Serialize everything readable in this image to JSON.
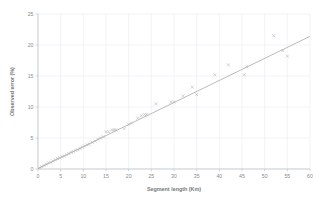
{
  "chart_data": {
    "type": "scatter",
    "title": "",
    "subtitle": "",
    "xlabel": "Segment length (Km)",
    "ylabel": "Observed error (%)",
    "xlim": [
      0,
      60
    ],
    "ylim": [
      0,
      25
    ],
    "xticks": [
      0,
      5,
      10,
      15,
      20,
      25,
      30,
      35,
      40,
      45,
      50,
      55,
      60
    ],
    "yticks": [
      0,
      5,
      10,
      15,
      20,
      25
    ],
    "xtick_labels": [
      "0",
      "5",
      "10",
      "15",
      "20",
      "25",
      "30",
      "35",
      "40",
      "45",
      "50",
      "55",
      "60"
    ],
    "ytick_labels": [
      "0",
      "5",
      "10",
      "15",
      "20",
      "25"
    ],
    "grid": true,
    "grid_axis": "both",
    "legend": false,
    "legend_position": "none",
    "marker_style": "x",
    "marker_color": "#b0b0b0",
    "line_color": "#a9a9a9",
    "grid_color": "#e9edf2",
    "axis_color": "#b9bec4",
    "background_color": "#ffffff",
    "series": [
      {
        "name": "Observed error",
        "type": "scatter",
        "marker": "x",
        "points": [
          [
            0.3,
            0.2
          ],
          [
            0.8,
            0.4
          ],
          [
            1.3,
            0.6
          ],
          [
            1.8,
            0.8
          ],
          [
            2.3,
            1.0
          ],
          [
            2.8,
            1.1
          ],
          [
            3.3,
            1.3
          ],
          [
            3.8,
            1.5
          ],
          [
            4.3,
            1.7
          ],
          [
            4.8,
            1.8
          ],
          [
            5.3,
            2.0
          ],
          [
            5.8,
            2.1
          ],
          [
            6.3,
            2.3
          ],
          [
            6.8,
            2.5
          ],
          [
            7.3,
            2.7
          ],
          [
            7.8,
            2.8
          ],
          [
            8.3,
            3.0
          ],
          [
            8.8,
            3.1
          ],
          [
            9.3,
            3.3
          ],
          [
            9.8,
            3.5
          ],
          [
            10.3,
            3.7
          ],
          [
            10.8,
            3.9
          ],
          [
            11.3,
            4.0
          ],
          [
            12.0,
            4.3
          ],
          [
            12.6,
            4.5
          ],
          [
            13.2,
            4.8
          ],
          [
            13.8,
            5.0
          ],
          [
            14.4,
            5.2
          ],
          [
            15.0,
            6.0
          ],
          [
            15.6,
            6.0
          ],
          [
            16.3,
            6.3
          ],
          [
            16.8,
            6.3
          ],
          [
            17.2,
            6.3
          ],
          [
            19.0,
            6.5
          ],
          [
            20.0,
            7.2
          ],
          [
            20.6,
            7.4
          ],
          [
            22.0,
            8.2
          ],
          [
            22.8,
            8.6
          ],
          [
            23.5,
            8.8
          ],
          [
            24.0,
            8.8
          ],
          [
            26.0,
            10.5
          ],
          [
            29.3,
            10.8
          ],
          [
            30.0,
            10.8
          ],
          [
            32.0,
            11.8
          ],
          [
            34.0,
            13.2
          ],
          [
            35.0,
            12.0
          ],
          [
            39.0,
            15.2
          ],
          [
            42.0,
            16.8
          ],
          [
            45.5,
            15.2
          ],
          [
            46.0,
            16.5
          ],
          [
            52.0,
            21.5
          ],
          [
            54.0,
            19.1
          ],
          [
            55.0,
            18.2
          ]
        ]
      },
      {
        "name": "Trend line",
        "type": "line",
        "slope": 0.355,
        "intercept": 0.05,
        "x_start": 0.0,
        "y_start": 0.05,
        "x_end": 60.0,
        "y_end": 21.4
      }
    ]
  }
}
